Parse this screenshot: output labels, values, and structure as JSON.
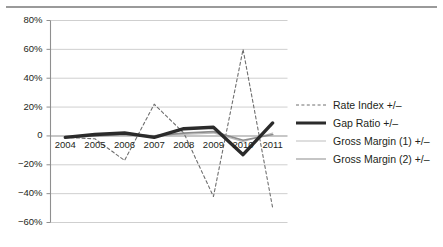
{
  "figure": {
    "background": "#ffffff",
    "rule_color": "#9a9a9a"
  },
  "legend": {
    "position": "right",
    "items": [
      {
        "label": "Rate Index +/–",
        "style": "dashed",
        "color": "#6f6f6f",
        "swatch": "dashed-line-swatch"
      },
      {
        "label": "Gap Ratio +/–",
        "style": "thick-solid",
        "color": "#2b2b2b",
        "swatch": "thick-line-swatch"
      },
      {
        "label": "Gross Margin (1) +/–",
        "style": "thin-solid",
        "color": "#bdbdbd",
        "swatch": "thin-line-swatch"
      },
      {
        "label": "Gross Margin (2) +/–",
        "style": "medium-solid",
        "color": "#8c8c8c",
        "swatch": "medium-line-swatch"
      }
    ]
  },
  "chart_data": {
    "type": "line",
    "title": "",
    "subtitle": "",
    "xlabel": "",
    "ylabel": "",
    "grid": true,
    "legend_position": "right",
    "categories": [
      "2004",
      "2005",
      "2006",
      "2007",
      "2008",
      "2009",
      "2010",
      "2011"
    ],
    "x_tick_labels": [
      "2004",
      "2005",
      "2006",
      "2007",
      "2008",
      "2009",
      "2010",
      "2011"
    ],
    "y_tick_labels": [
      "80%",
      "60%",
      "40%",
      "20%",
      "0",
      "−20%",
      "−40%",
      "−60%"
    ],
    "y_ticks": [
      80,
      60,
      40,
      20,
      0,
      -20,
      -40,
      -60
    ],
    "ylim": [
      -60,
      80
    ],
    "y_unit": "percent",
    "series": [
      {
        "name": "Rate Index +/–",
        "style": "dashed",
        "color": "#6f6f6f",
        "width": 1.1,
        "values": [
          -1,
          -2,
          -17,
          22,
          2,
          -42,
          60,
          -50
        ]
      },
      {
        "name": "Gap Ratio +/–",
        "style": "solid",
        "color": "#2b2b2b",
        "width": 3.4,
        "values": [
          -1,
          1,
          2,
          -1,
          5,
          6,
          -13,
          9
        ]
      },
      {
        "name": "Gross Margin (1) +/–",
        "style": "solid",
        "color": "#bdbdbd",
        "width": 1.2,
        "values": [
          -1,
          0,
          1,
          0,
          1,
          2,
          -4,
          2
        ]
      },
      {
        "name": "Gross Margin (2) +/–",
        "style": "solid",
        "color": "#8c8c8c",
        "width": 1.7,
        "values": [
          -1,
          0,
          1,
          0,
          2,
          3,
          -3,
          1
        ]
      }
    ]
  },
  "axes": {
    "axis_color": "#8f8f8f",
    "grid_color": "#c9c9c9",
    "zero_line_color": "#8f8f8f"
  }
}
